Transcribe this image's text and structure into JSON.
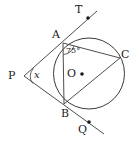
{
  "figure": {
    "type": "circle-geometry-diagram",
    "stroke_color": "#3a3a3a",
    "text_color": "#1a1a1a",
    "background": "#ffffff",
    "circle": {
      "cx": 89,
      "cy": 73.5,
      "r": 35.5
    },
    "points": [
      {
        "name": "A",
        "x": 63,
        "y": 43,
        "label": "A",
        "label_x": 52,
        "label_y": 29
      },
      {
        "name": "B",
        "x": 64,
        "y": 104,
        "label": "B",
        "label_x": 62,
        "label_y": 108
      },
      {
        "name": "C",
        "x": 120,
        "y": 58,
        "label": "C",
        "label_x": 122,
        "label_y": 50
      },
      {
        "name": "O",
        "x": 89,
        "y": 73.5,
        "label": "O",
        "label_x": 68,
        "label_y": 68
      },
      {
        "name": "P",
        "x": 24,
        "y": 76,
        "label": "P",
        "label_x": 9,
        "label_y": 70
      },
      {
        "name": "T",
        "x": 88,
        "y": 18,
        "label": "T",
        "label_x": 75,
        "label_y": 5
      },
      {
        "name": "Q",
        "x": 89,
        "y": 122,
        "label": "Q",
        "label_x": 78,
        "label_y": 124
      }
    ],
    "segments": [
      {
        "name": "line-P-A-T",
        "x1": 24,
        "y1": 76,
        "x2": 97,
        "y2": 11
      },
      {
        "name": "line-P-B-Q",
        "x1": 24,
        "y1": 76,
        "x2": 104,
        "y2": 134
      },
      {
        "name": "chord-A-B",
        "x1": 63,
        "y1": 43,
        "x2": 64,
        "y2": 104
      },
      {
        "name": "chord-A-C",
        "x1": 63,
        "y1": 43,
        "x2": 120,
        "y2": 58
      },
      {
        "name": "chord-B-C",
        "x1": 64,
        "y1": 104,
        "x2": 120,
        "y2": 58
      }
    ],
    "angles": [
      {
        "name": "angle-at-A",
        "value": "75",
        "unit": "°",
        "vertex": "A",
        "label_x": 66,
        "label_y": 48
      },
      {
        "name": "angle-at-P",
        "value": "x",
        "vertex": "P",
        "label_x": 34,
        "label_y": 71
      }
    ],
    "markers": [
      {
        "name": "center-dot-O",
        "x": 82,
        "y": 74,
        "r": 1.8
      },
      {
        "name": "point-dot-T",
        "x": 88,
        "y": 18,
        "r": 1.8
      },
      {
        "name": "point-dot-Q",
        "x": 89,
        "y": 122,
        "r": 1.8
      }
    ],
    "labels": {
      "A": "A",
      "B": "B",
      "C": "C",
      "O": "O",
      "P": "P",
      "T": "T",
      "Q": "Q",
      "angle_A": "75°",
      "angle_P": "x"
    }
  }
}
